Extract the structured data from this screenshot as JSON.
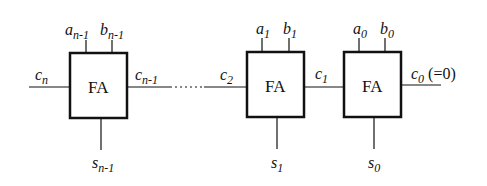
{
  "diagram": {
    "blocks": [
      {
        "label": "FA",
        "a": "a",
        "a_sub": "n-1",
        "b": "b",
        "b_sub": "n-1",
        "s": "s",
        "s_sub": "n-1",
        "cin_left": "c",
        "cin_left_sub": "n",
        "cout_right": "c",
        "cout_right_sub": "n-1"
      },
      {
        "label": "FA",
        "a": "a",
        "a_sub": "1",
        "b": "b",
        "b_sub": "1",
        "s": "s",
        "s_sub": "1",
        "cin_left": "c",
        "cin_left_sub": "2"
      },
      {
        "label": "FA",
        "a": "a",
        "a_sub": "0",
        "b": "b",
        "b_sub": "0",
        "s": "s",
        "s_sub": "0",
        "mid": "c",
        "mid_sub": "1",
        "cout_right": "c",
        "cout_right_sub": "0",
        "note": "(=0)"
      }
    ],
    "colors": {
      "stroke": "#111111",
      "background": "#ffffff"
    }
  }
}
